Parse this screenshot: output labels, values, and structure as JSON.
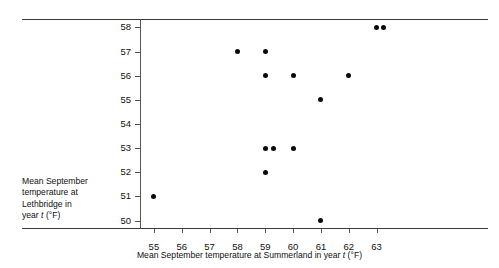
{
  "chart_data": {
    "type": "scatter",
    "title": "",
    "xlabel": "Mean September temperature at Summerland in year t (°F)",
    "ylabel": "Mean September temperature at Lethbridge in year t (°F)",
    "xlim": [
      54.5,
      67.0
    ],
    "ylim": [
      49.65,
      58.35
    ],
    "xticks": [
      55,
      56,
      57,
      58,
      59,
      60,
      61,
      62,
      63
    ],
    "yticks": [
      50,
      51,
      52,
      53,
      54,
      55,
      56,
      57,
      58
    ],
    "xticklabels": [
      "55",
      "56",
      "57",
      "58",
      "59",
      "60",
      "61",
      "62",
      "63"
    ],
    "yticklabels": [
      "50",
      "51",
      "52",
      "53",
      "54",
      "55",
      "56",
      "57",
      "58"
    ],
    "grid": false,
    "legend": false,
    "marker": "filled-circle",
    "marker_color": "#0b0b0b",
    "points": [
      {
        "x": 55.0,
        "y": 51.0
      },
      {
        "x": 58.0,
        "y": 57.0
      },
      {
        "x": 59.0,
        "y": 57.0
      },
      {
        "x": 59.0,
        "y": 56.0
      },
      {
        "x": 59.0,
        "y": 53.0
      },
      {
        "x": 59.3,
        "y": 53.0
      },
      {
        "x": 59.0,
        "y": 52.0
      },
      {
        "x": 60.0,
        "y": 56.0
      },
      {
        "x": 60.0,
        "y": 53.0
      },
      {
        "x": 61.0,
        "y": 55.0
      },
      {
        "x": 61.0,
        "y": 50.0
      },
      {
        "x": 62.0,
        "y": 56.0
      },
      {
        "x": 63.0,
        "y": 58.0
      },
      {
        "x": 63.25,
        "y": 58.0
      }
    ]
  },
  "axis_titles": {
    "y": {
      "line1": "Mean September",
      "line2": "temperature at",
      "line3": "Lethbridge in",
      "line4_pre": "year ",
      "line4_var": "t",
      "line4_post": " (°F)"
    },
    "x": {
      "pre": "Mean September temperature at Summerland in year ",
      "var": "t",
      "post": " (°F)"
    }
  },
  "colors": {
    "marker": "#0b0b0b",
    "rule": "#3a3a3a",
    "axis": "#555555",
    "text": "#111111",
    "background": "#ffffff"
  }
}
